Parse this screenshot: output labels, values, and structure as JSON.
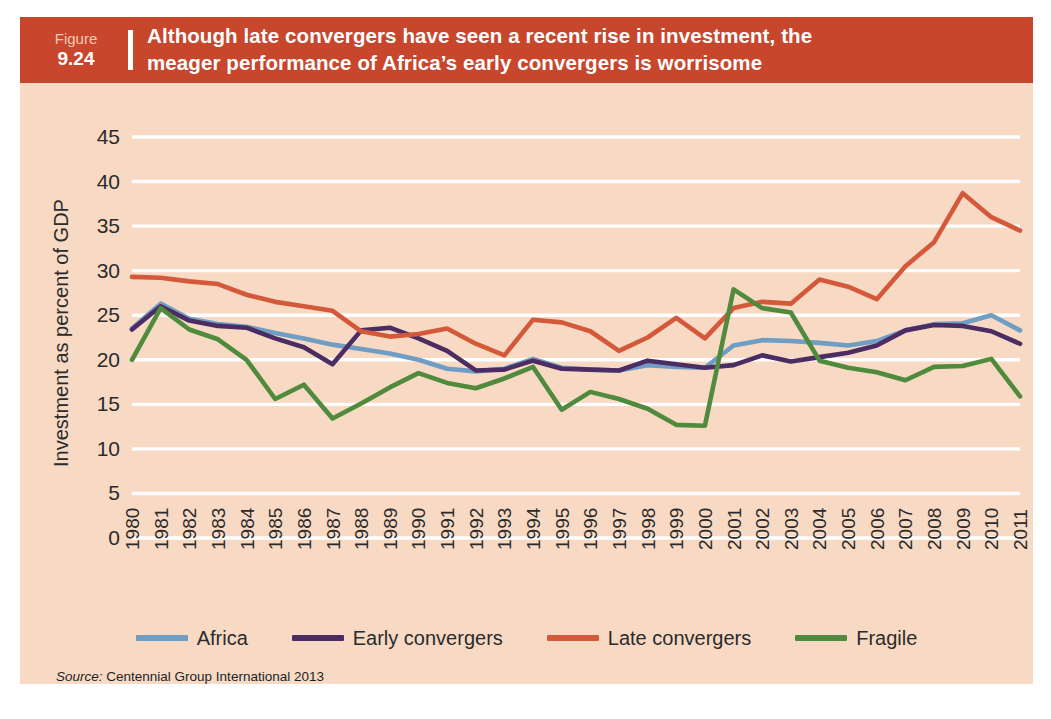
{
  "figure": {
    "word": "Figure",
    "number": "9.24",
    "title_line1": "Although late convergers have seen a recent rise in investment, the",
    "title_line2": "meager performance of Africa’s early convergers is worrisome",
    "header_color": "#c8472c",
    "panel_color": "#f7d9c4"
  },
  "source": {
    "label": "Source:",
    "text": "Centennial Group International 2013"
  },
  "legend": {
    "position": "bottom",
    "items": [
      {
        "label": "Africa",
        "color": "#6f9dc4"
      },
      {
        "label": "Early convergers",
        "color": "#4b2d63"
      },
      {
        "label": "Late convergers",
        "color": "#d4593a"
      },
      {
        "label": "Fragile",
        "color": "#4f8a3d"
      }
    ]
  },
  "chart_data": {
    "type": "line",
    "title": "Although late convergers have seen a recent rise in investment, the meager performance of Africa’s early convergers is worrisome",
    "xlabel": "",
    "ylabel": "Investment as percent of GDP",
    "ylim": [
      0,
      45
    ],
    "ytick_step": 5,
    "yticks": [
      0,
      5,
      10,
      15,
      20,
      25,
      30,
      35,
      40,
      45
    ],
    "grid": true,
    "grid_color": "#ffffff",
    "x": [
      1980,
      1981,
      1982,
      1983,
      1984,
      1985,
      1986,
      1987,
      1988,
      1989,
      1990,
      1991,
      1992,
      1993,
      1994,
      1995,
      1996,
      1997,
      1998,
      1999,
      2000,
      2001,
      2002,
      2003,
      2004,
      2005,
      2006,
      2007,
      2008,
      2009,
      2010,
      2011
    ],
    "series": [
      {
        "name": "Africa",
        "color": "#6f9dc4",
        "values": [
          23.5,
          26.3,
          24.6,
          24.0,
          23.7,
          23.0,
          22.4,
          21.7,
          21.2,
          20.7,
          20.0,
          19.0,
          18.7,
          19.0,
          20.1,
          19.1,
          18.9,
          18.8,
          19.4,
          19.2,
          19.1,
          21.6,
          22.2,
          22.1,
          21.9,
          21.6,
          22.1,
          23.3,
          24.0,
          24.1,
          25.0,
          23.3
        ]
      },
      {
        "name": "Early convergers",
        "color": "#4b2d63",
        "values": [
          23.4,
          26.0,
          24.4,
          23.8,
          23.6,
          22.4,
          21.4,
          19.5,
          23.3,
          23.6,
          22.4,
          21.0,
          18.8,
          18.9,
          19.9,
          19.0,
          18.9,
          18.8,
          19.9,
          19.5,
          19.1,
          19.4,
          20.5,
          19.8,
          20.3,
          20.8,
          21.6,
          23.3,
          23.9,
          23.8,
          23.2,
          21.8
        ]
      },
      {
        "name": "Late convergers",
        "color": "#d4593a",
        "values": [
          29.3,
          29.2,
          28.8,
          28.5,
          27.3,
          26.5,
          26.0,
          25.5,
          23.2,
          22.6,
          22.9,
          23.5,
          21.8,
          20.5,
          24.5,
          24.2,
          23.2,
          21.0,
          22.5,
          24.7,
          22.4,
          25.8,
          26.5,
          26.3,
          29.0,
          28.2,
          26.8,
          30.5,
          33.2,
          38.7,
          36.0,
          34.5
        ]
      },
      {
        "name": "Fragile",
        "color": "#4f8a3d",
        "values": [
          20.0,
          25.8,
          23.4,
          22.3,
          20.0,
          15.6,
          17.2,
          13.4,
          15.1,
          16.9,
          18.5,
          17.4,
          16.8,
          17.9,
          19.2,
          14.4,
          16.4,
          15.6,
          14.5,
          12.7,
          12.6,
          27.9,
          25.8,
          25.3,
          19.9,
          19.1,
          18.6,
          17.7,
          19.2,
          19.3,
          20.1,
          15.9
        ]
      }
    ]
  }
}
